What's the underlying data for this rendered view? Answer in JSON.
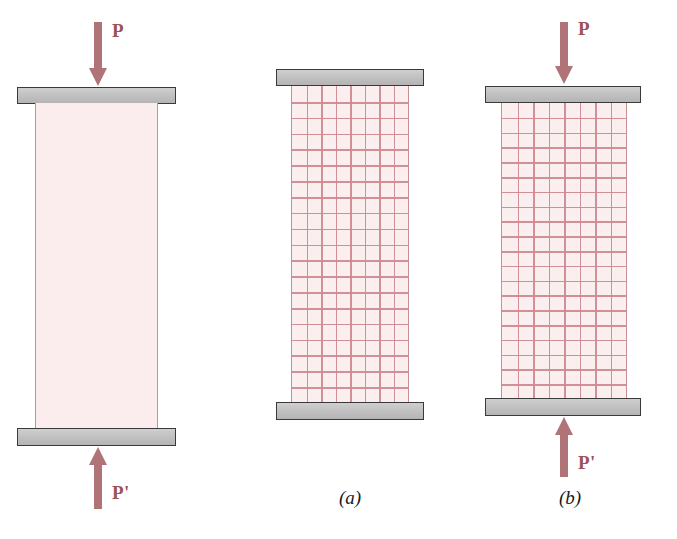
{
  "figure": {
    "colors": {
      "platen_fill": "#c6c6c6",
      "platen_border": "#3a3a3a",
      "specimen_fill": "#fbeeee",
      "specimen_edge": "#c98f93",
      "grid_line": "#cf8a90",
      "arrow": "#b07378",
      "label_text": "#9c5257",
      "caption_text": "#1a1a1a",
      "background": "#ffffff"
    }
  },
  "panels": [
    {
      "id": "undeformed-specimen",
      "caption": "",
      "load_top": {
        "label": "P",
        "direction": "down"
      },
      "load_bottom": {
        "label": "P'",
        "direction": "up"
      },
      "grid": {
        "shown": false,
        "columns": 0,
        "rows": 0
      },
      "specimen": {
        "x": 35,
        "y": 103,
        "width": 123,
        "height": 326
      },
      "top_platen": {
        "x": 17,
        "y": 87,
        "width": 159,
        "height": 17
      },
      "bottom_platen": {
        "x": 17,
        "y": 428,
        "width": 159,
        "height": 18
      }
    },
    {
      "id": "original-grid-specimen",
      "caption": "(a)",
      "load_top": {
        "label": "",
        "direction": "none"
      },
      "load_bottom": {
        "label": "",
        "direction": "none"
      },
      "grid": {
        "shown": true,
        "columns": 8,
        "rows": 20
      },
      "specimen": {
        "x": 291,
        "y": 86,
        "width": 118,
        "height": 317
      },
      "top_platen": {
        "x": 276,
        "y": 69,
        "width": 148,
        "height": 17
      },
      "bottom_platen": {
        "x": 276,
        "y": 402,
        "width": 148,
        "height": 18
      }
    },
    {
      "id": "deformed-grid-specimen",
      "caption": "(b)",
      "load_top": {
        "label": "P",
        "direction": "down"
      },
      "load_bottom": {
        "label": "P'",
        "direction": "up"
      },
      "grid": {
        "shown": true,
        "columns": 8,
        "rows": 20
      },
      "specimen": {
        "x": 501,
        "y": 103,
        "width": 126,
        "height": 296
      },
      "top_platen": {
        "x": 485,
        "y": 86,
        "width": 156,
        "height": 17
      },
      "bottom_platen": {
        "x": 485,
        "y": 398,
        "width": 156,
        "height": 18
      }
    }
  ],
  "captions": {
    "a": "(a)",
    "b": "(b)"
  },
  "labels": {
    "p": "P",
    "p_prime": "P'"
  }
}
